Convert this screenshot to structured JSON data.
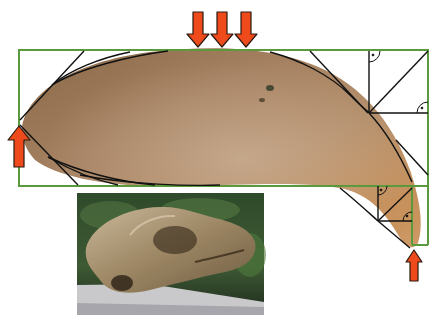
{
  "figure": {
    "colors": {
      "bounding_box": "#5a9a3c",
      "construction_lines": "#111111",
      "arrow_fill": "#ee4a1c",
      "arrow_stroke": "#2a1a10",
      "fossil_base": "#a07a52",
      "fossil_light": "#c9a27a",
      "fossil_tip": "#c98f5a",
      "background": "#ffffff"
    },
    "arrows": [
      {
        "id": "top-1",
        "direction": "down"
      },
      {
        "id": "top-2",
        "direction": "down"
      },
      {
        "id": "top-3",
        "direction": "down"
      },
      {
        "id": "left",
        "direction": "up"
      },
      {
        "id": "bottom-right",
        "direction": "up"
      }
    ],
    "right_angle_markers": 4,
    "inset_photo": {
      "subject": "skull on a stone ledge with green foliage background"
    }
  }
}
